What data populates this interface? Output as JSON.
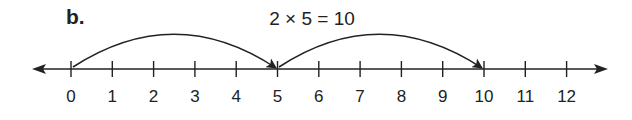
{
  "part_label": "b.",
  "equation": "2 × 5 = 10",
  "colors": {
    "ink": "#222222",
    "background": "#ffffff"
  },
  "number_line": {
    "min": 0,
    "max": 12,
    "step": 1,
    "tick_labels": [
      "0",
      "1",
      "2",
      "3",
      "4",
      "5",
      "6",
      "7",
      "8",
      "9",
      "10",
      "11",
      "12"
    ],
    "arrows_both_ends": true
  },
  "jumps": [
    {
      "from": 0,
      "to": 5,
      "size": 5
    },
    {
      "from": 5,
      "to": 10,
      "size": 5
    }
  ]
}
